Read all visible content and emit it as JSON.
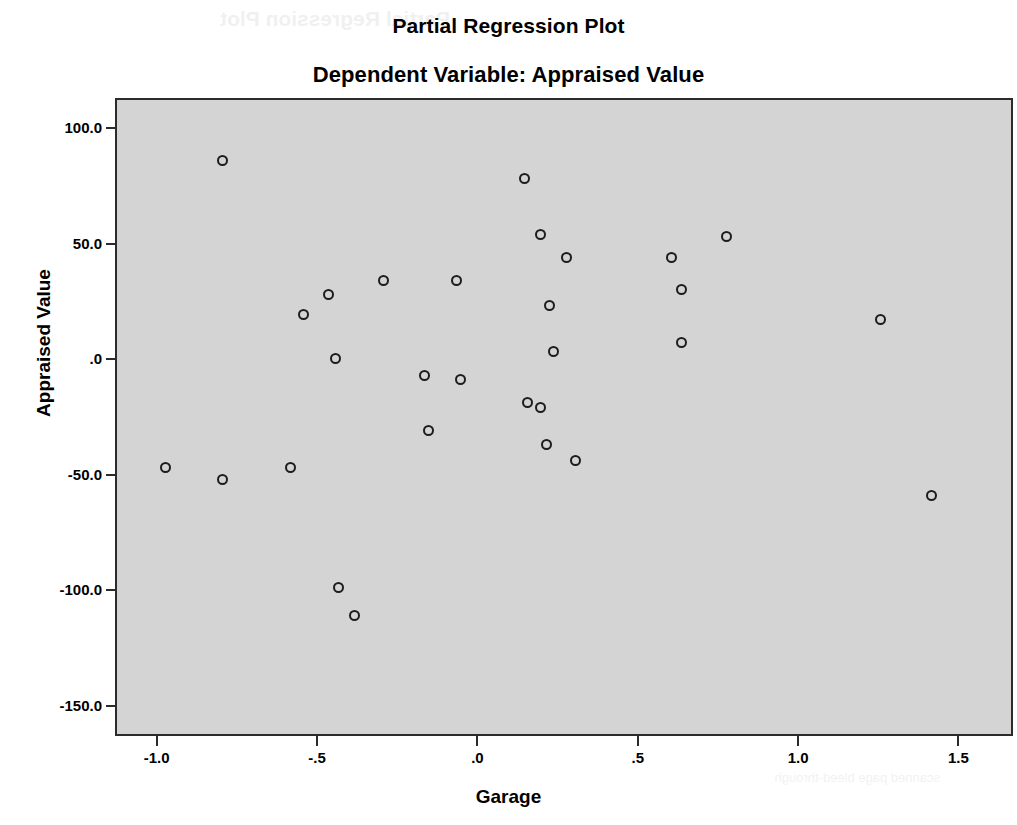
{
  "titles": {
    "main": "Partial Regression Plot",
    "sub": "Dependent Variable: Appraised Value"
  },
  "scan_artifact": {
    "top_text": "Partial Regression Plot",
    "bottom_text": "scanned page bleed-through"
  },
  "chart_data": {
    "type": "scatter",
    "title": "Partial Regression Plot",
    "subtitle": "Dependent Variable: Appraised Value",
    "xlabel": "Garage",
    "ylabel": "Appraised Value",
    "xlim": [
      -1.13,
      1.67
    ],
    "ylim": [
      -163,
      113
    ],
    "xticks": [
      -1.0,
      -0.5,
      0.0,
      0.5,
      1.0,
      1.5
    ],
    "xtick_labels": [
      "-1.0",
      "-.5",
      ".0",
      ".5",
      "1.0",
      "1.5"
    ],
    "yticks": [
      100.0,
      50.0,
      0.0,
      -50.0,
      -100.0,
      -150.0
    ],
    "ytick_labels": [
      "100.0",
      "50.0",
      ".0",
      "-50.0",
      "-100.0",
      "-150.0"
    ],
    "grid": false,
    "legend": null,
    "marker": "open-circle",
    "marker_color": "#1d1d1d",
    "plot_background": "#d4d4d4",
    "points": [
      {
        "x": -0.8,
        "y": 87
      },
      {
        "x": -0.98,
        "y": -46
      },
      {
        "x": -0.8,
        "y": -51
      },
      {
        "x": -0.59,
        "y": -46
      },
      {
        "x": -0.55,
        "y": 20
      },
      {
        "x": -0.47,
        "y": 29
      },
      {
        "x": -0.45,
        "y": 1
      },
      {
        "x": -0.44,
        "y": -98
      },
      {
        "x": -0.39,
        "y": -110
      },
      {
        "x": -0.3,
        "y": 35
      },
      {
        "x": -0.17,
        "y": -6
      },
      {
        "x": -0.16,
        "y": -30
      },
      {
        "x": -0.07,
        "y": 35
      },
      {
        "x": -0.06,
        "y": -8
      },
      {
        "x": 0.14,
        "y": 79
      },
      {
        "x": 0.15,
        "y": -18
      },
      {
        "x": 0.19,
        "y": -20
      },
      {
        "x": 0.19,
        "y": 55
      },
      {
        "x": 0.21,
        "y": -36
      },
      {
        "x": 0.22,
        "y": 24
      },
      {
        "x": 0.23,
        "y": 4
      },
      {
        "x": 0.27,
        "y": 45
      },
      {
        "x": 0.3,
        "y": -43
      },
      {
        "x": 0.6,
        "y": 45
      },
      {
        "x": 0.63,
        "y": 31
      },
      {
        "x": 0.63,
        "y": 8
      },
      {
        "x": 0.77,
        "y": 54
      },
      {
        "x": 1.25,
        "y": 18
      },
      {
        "x": 1.41,
        "y": -58
      }
    ]
  }
}
